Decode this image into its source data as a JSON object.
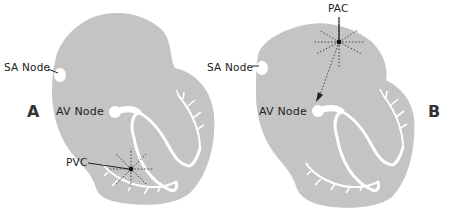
{
  "colors": {
    "heart_fill": "#c4c4c4",
    "conduction": "#ffffff",
    "text": "#222222",
    "ectopic_focus": "#111111"
  },
  "panels": [
    {
      "letter": "A",
      "labels": {
        "sa_node": "SA Node",
        "av_node": "AV Node",
        "ectopic": "PVC"
      },
      "ectopic_location": "ventricle"
    },
    {
      "letter": "B",
      "labels": {
        "sa_node": "SA Node",
        "av_node": "AV Node",
        "ectopic": "PAC"
      },
      "ectopic_location": "atrium"
    }
  ]
}
